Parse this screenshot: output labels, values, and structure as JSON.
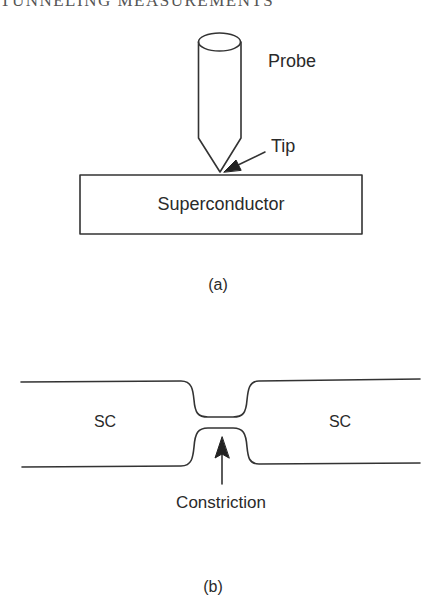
{
  "running_head": "TUNNELING MEASUREMENTS",
  "panel_a": {
    "labels": {
      "probe": "Probe",
      "tip": "Tip",
      "sample": "Superconductor"
    },
    "caption": "(a)"
  },
  "panel_b": {
    "labels": {
      "left_region": "SC",
      "right_region": "SC",
      "constriction": "Constriction"
    },
    "caption": "(b)"
  },
  "colors": {
    "line": "#333333",
    "text": "#2a2a2a",
    "background": "#ffffff"
  }
}
